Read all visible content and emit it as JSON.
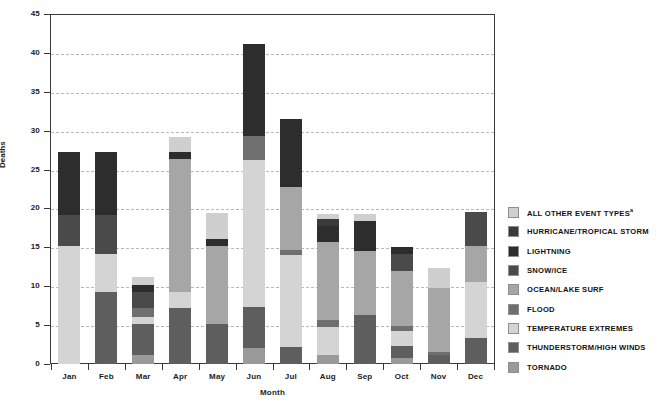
{
  "chart_data": {
    "type": "bar",
    "stacked": true,
    "title": "",
    "xlabel": "Month",
    "ylabel": "Deaths",
    "ylim": [
      0,
      45
    ],
    "yticks": [
      0,
      5,
      10,
      15,
      20,
      25,
      30,
      35,
      40,
      45
    ],
    "grid": true,
    "legend_position": "right",
    "categories": [
      "Jan",
      "Feb",
      "Mar",
      "Apr",
      "May",
      "Jun",
      "Jul",
      "Aug",
      "Sep",
      "Oct",
      "Nov",
      "Dec"
    ],
    "series": [
      {
        "name": "TORNADO",
        "color": "#9a9a9a",
        "values": [
          0,
          0,
          1.2,
          0,
          0,
          2.0,
          0,
          1.2,
          0,
          0.8,
          0,
          0
        ]
      },
      {
        "name": "THUNDERSTORM/HIGH WINDS",
        "color": "#5e5e5e",
        "values": [
          0,
          9.2,
          4.0,
          7.2,
          5.2,
          5.3,
          2.2,
          0,
          6.3,
          1.5,
          1.1,
          3.3
        ]
      },
      {
        "name": "TEMPERATURE EXTREMES",
        "color": "#d4d4d4",
        "values": [
          15.2,
          5.0,
          0.8,
          2.0,
          0,
          18.9,
          11.8,
          3.6,
          0,
          2.0,
          0,
          7.3
        ]
      },
      {
        "name": "FLOOD",
        "color": "#6f6f6f",
        "values": [
          0,
          0,
          1.2,
          0,
          0,
          3.1,
          0.6,
          0.9,
          0,
          0.6,
          0.4,
          0
        ]
      },
      {
        "name": "OCEAN/LAKE SURF",
        "color": "#a6a6a6",
        "values": [
          0,
          0,
          0,
          17.2,
          10.0,
          0,
          8.2,
          10.0,
          8.2,
          7.1,
          8.3,
          4.6
        ]
      },
      {
        "name": "SNOW/ICE",
        "color": "#4a4a4a",
        "values": [
          4.0,
          5.0,
          2.0,
          0,
          0,
          0,
          0,
          0,
          0,
          2.1,
          0,
          4.3
        ]
      },
      {
        "name": "LIGHTNING",
        "color": "#2d2d2d",
        "values": [
          8.0,
          8.0,
          1.0,
          0.9,
          0.9,
          11.9,
          8.7,
          2.1,
          3.9,
          1.0,
          0,
          0
        ]
      },
      {
        "name": "HURRICANE/TROPICAL STORM",
        "color": "#3a3a3a",
        "values": [
          0,
          0,
          0,
          0,
          0,
          0,
          0,
          0.9,
          0,
          0,
          0,
          0
        ]
      },
      {
        "name": "ALL OTHER EVENT TYPES",
        "color": "#cfcfcf",
        "values": [
          0,
          0,
          1.0,
          1.9,
          3.3,
          0,
          0,
          0.6,
          0.9,
          0,
          2.5,
          0
        ]
      }
    ],
    "totals": [
      27.2,
      27.2,
      11.2,
      29.2,
      19.4,
      41.2,
      31.5,
      19.3,
      19.3,
      15.1,
      12.3,
      19.5
    ]
  },
  "legend": {
    "items": [
      {
        "label": "ALL OTHER EVENT TYPES",
        "superscript": "a",
        "color": "#cfcfcf"
      },
      {
        "label": "HURRICANE/TROPICAL STORM",
        "superscript": "",
        "color": "#3a3a3a"
      },
      {
        "label": "LIGHTNING",
        "superscript": "",
        "color": "#2d2d2d"
      },
      {
        "label": "SNOW/ICE",
        "superscript": "",
        "color": "#4a4a4a"
      },
      {
        "label": "OCEAN/LAKE SURF",
        "superscript": "",
        "color": "#a6a6a6"
      },
      {
        "label": "FLOOD",
        "superscript": "",
        "color": "#6f6f6f"
      },
      {
        "label": "TEMPERATURE EXTREMES",
        "superscript": "",
        "color": "#d4d4d4"
      },
      {
        "label": "THUNDERSTORM/HIGH WINDS",
        "superscript": "",
        "color": "#5e5e5e"
      },
      {
        "label": "TORNADO",
        "superscript": "",
        "color": "#9a9a9a"
      }
    ]
  },
  "axes": {
    "y_title": "Deaths",
    "x_title": "Month"
  }
}
